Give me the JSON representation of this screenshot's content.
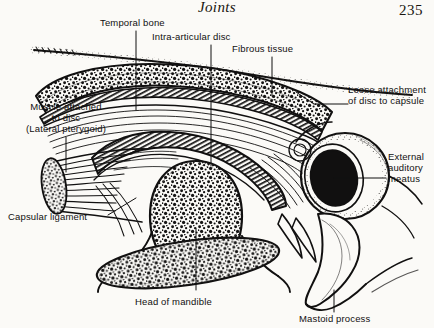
{
  "page": {
    "running_head": "Joints",
    "folio": "235"
  },
  "figure": {
    "labels": [
      {
        "id": "temporal-bone",
        "text": "Temporal bone"
      },
      {
        "id": "intra-articular-disc",
        "text": "Intra-articular disc"
      },
      {
        "id": "fibrous-tissue",
        "text": "Fibrous tissue"
      },
      {
        "id": "loose-attachment",
        "line1": "Loose attachment",
        "line2": "of disc to capsule"
      },
      {
        "id": "external-auditory-meatus",
        "line1": "External",
        "line2": "auditory",
        "line3": "meatus"
      },
      {
        "id": "muscle-attached-to-disc",
        "line1": "Muscle attached",
        "line2": "to disc",
        "line3": "(Lateral pterygoid)"
      },
      {
        "id": "capsular-ligament",
        "text": "Capsular ligament"
      },
      {
        "id": "head-of-mandible",
        "text": "Head of mandible"
      },
      {
        "id": "mastoid-process",
        "text": "Mastoid process"
      }
    ],
    "colors": {
      "ink": "#111010",
      "paper": "#fbfaf7"
    }
  }
}
